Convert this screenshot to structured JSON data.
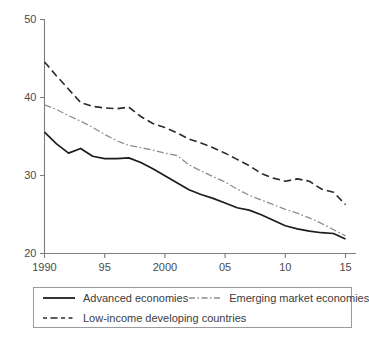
{
  "chart_data": {
    "type": "line",
    "title": "",
    "subtitle": "",
    "xlabel": "",
    "ylabel": "",
    "xlim": [
      1990,
      2015
    ],
    "ylim": [
      20,
      50
    ],
    "grid": false,
    "legend_position": "bottom",
    "x": [
      1990,
      1991,
      1992,
      1993,
      1994,
      1995,
      1996,
      1997,
      1998,
      1999,
      2000,
      2001,
      2002,
      2003,
      2004,
      2005,
      2006,
      2007,
      2008,
      2009,
      2010,
      2011,
      2012,
      2013,
      2014,
      2015
    ],
    "xticks": [
      1990,
      1995,
      2000,
      2005,
      2010,
      2015
    ],
    "xticklabels": [
      "1990",
      "95",
      "2000",
      "05",
      "10",
      "15"
    ],
    "yticks": [
      20,
      30,
      40,
      50
    ],
    "yticklabels": [
      "20",
      "30",
      "40",
      "50"
    ],
    "series": [
      {
        "name": "Advanced economies",
        "style": "solid",
        "color": "#1c1c1c",
        "values": [
          35.5,
          34.0,
          32.8,
          33.4,
          32.4,
          32.1,
          32.1,
          32.2,
          31.6,
          30.8,
          29.9,
          29.0,
          28.1,
          27.5,
          27.0,
          26.4,
          25.8,
          25.5,
          24.9,
          24.2,
          23.5,
          23.1,
          22.8,
          22.6,
          22.5,
          21.8
        ]
      },
      {
        "name": "Emerging market economies",
        "style": "dash-dot",
        "color": "#8d8d8d",
        "values": [
          39.0,
          38.4,
          37.6,
          36.9,
          36.1,
          35.2,
          34.4,
          33.8,
          33.5,
          33.2,
          32.8,
          32.5,
          31.3,
          30.5,
          29.8,
          29.1,
          28.2,
          27.4,
          26.8,
          26.2,
          25.6,
          25.1,
          24.5,
          23.8,
          23.0,
          22.2
        ]
      },
      {
        "name": "Low-income developing countries",
        "style": "dashed",
        "color": "#2b2b2b",
        "values": [
          44.5,
          42.7,
          41.0,
          39.3,
          38.8,
          38.6,
          38.5,
          38.7,
          37.5,
          36.6,
          36.1,
          35.4,
          34.6,
          34.1,
          33.5,
          32.8,
          32.0,
          31.2,
          30.2,
          29.6,
          29.2,
          29.5,
          29.2,
          28.2,
          27.8,
          26.2
        ]
      }
    ]
  },
  "legend": {
    "entries": [
      {
        "label": "Advanced economies",
        "style": "solid"
      },
      {
        "label": "Emerging market economies",
        "style": "dash-dot"
      },
      {
        "label": "Low-income developing countries",
        "style": "dashed"
      }
    ]
  }
}
